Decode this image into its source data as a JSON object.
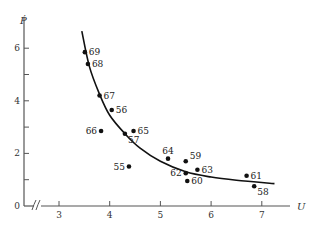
{
  "chart_data": {
    "type": "scatter",
    "title": "",
    "xlabel": "U",
    "ylabel": "Ṗ",
    "xlim": [
      2.3,
      7.7
    ],
    "ylim": [
      0,
      7
    ],
    "x_axis_break": true,
    "grid": false,
    "legend": null,
    "x_ticks": [
      3,
      4,
      5,
      6,
      7
    ],
    "y_ticks": [
      0,
      1,
      2,
      3,
      4,
      5,
      6
    ],
    "y_tick_labels": [
      "0",
      "",
      "2",
      "",
      "4",
      "",
      "6"
    ],
    "series": [
      {
        "name": "observations",
        "kind": "scatter",
        "points": [
          {
            "label": "69",
            "x": 3.51,
            "y": 5.85,
            "label_pos": "right"
          },
          {
            "label": "68",
            "x": 3.57,
            "y": 5.4,
            "label_pos": "right"
          },
          {
            "label": "67",
            "x": 3.8,
            "y": 4.2,
            "label_pos": "right"
          },
          {
            "label": "56",
            "x": 4.04,
            "y": 3.65,
            "label_pos": "right"
          },
          {
            "label": "66",
            "x": 3.83,
            "y": 2.85,
            "label_pos": "left"
          },
          {
            "label": "57",
            "x": 4.3,
            "y": 2.75,
            "label_pos": "below-right"
          },
          {
            "label": "65",
            "x": 4.47,
            "y": 2.85,
            "label_pos": "right"
          },
          {
            "label": "55",
            "x": 4.38,
            "y": 1.5,
            "label_pos": "left"
          },
          {
            "label": "64",
            "x": 5.15,
            "y": 1.8,
            "label_pos": "above"
          },
          {
            "label": "59",
            "x": 5.5,
            "y": 1.7,
            "label_pos": "above-right"
          },
          {
            "label": "63",
            "x": 5.73,
            "y": 1.38,
            "label_pos": "right"
          },
          {
            "label": "62",
            "x": 5.5,
            "y": 1.25,
            "label_pos": "left"
          },
          {
            "label": "60",
            "x": 5.53,
            "y": 0.95,
            "label_pos": "right"
          },
          {
            "label": "61",
            "x": 6.7,
            "y": 1.15,
            "label_pos": "right"
          },
          {
            "label": "58",
            "x": 6.85,
            "y": 0.75,
            "label_pos": "below-right"
          }
        ]
      },
      {
        "name": "fitted curve",
        "kind": "line",
        "points": [
          {
            "x": 3.45,
            "y": 6.65
          },
          {
            "x": 3.6,
            "y": 5.3
          },
          {
            "x": 3.8,
            "y": 4.25
          },
          {
            "x": 4.0,
            "y": 3.45
          },
          {
            "x": 4.3,
            "y": 2.75
          },
          {
            "x": 4.6,
            "y": 2.2
          },
          {
            "x": 5.0,
            "y": 1.7
          },
          {
            "x": 5.5,
            "y": 1.3
          },
          {
            "x": 6.0,
            "y": 1.1
          },
          {
            "x": 6.5,
            "y": 0.98
          },
          {
            "x": 7.25,
            "y": 0.85
          }
        ]
      }
    ]
  }
}
